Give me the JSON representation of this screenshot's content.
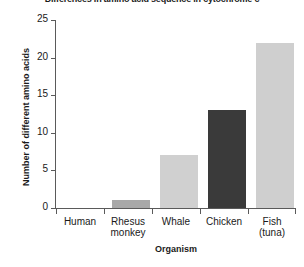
{
  "chart_data": {
    "type": "bar",
    "title": "Differences in amino acid sequence in cytochrome c",
    "xlabel": "Organism",
    "ylabel": "Number of different amino acids",
    "categories": [
      "Human",
      "Rhesus monkey",
      "Whale",
      "Chicken",
      "Fish (tuna)"
    ],
    "category_lines": [
      [
        "Human"
      ],
      [
        "Rhesus",
        "monkey"
      ],
      [
        "Whale"
      ],
      [
        "Chicken"
      ],
      [
        "Fish",
        "(tuna)"
      ]
    ],
    "values": [
      0,
      1,
      7,
      13,
      22
    ],
    "ylim": [
      0,
      25
    ],
    "yticks": [
      0,
      5,
      10,
      15,
      20,
      25
    ],
    "ytick_labels": [
      "0",
      "5",
      "10",
      "15",
      "20",
      "25"
    ],
    "grid": false,
    "legend": "none",
    "bar_colors": [
      "#d0d0d0",
      "#a8a8a8",
      "#d0d0d0",
      "#3a3a3a",
      "#cfcfcf"
    ],
    "axis_color": "#5a5a5a",
    "text_color": "#1a1a1a",
    "background": "#ffffff"
  }
}
